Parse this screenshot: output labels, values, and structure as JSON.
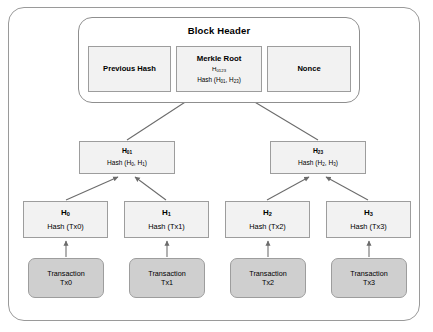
{
  "diagram": {
    "title": "Block Header",
    "header_fields": [
      {
        "name": "previous-hash",
        "label": "Previous Hash"
      },
      {
        "name": "merkle-root",
        "label": "Merkle Root",
        "hash_id": "H0123",
        "formula": "Hash (H01, H23)"
      },
      {
        "name": "nonce",
        "label": "Nonce"
      }
    ],
    "intermediate_nodes": [
      {
        "name": "h01",
        "hash_id": "H01",
        "formula": "Hash (H0, H1)"
      },
      {
        "name": "h23",
        "hash_id": "H23",
        "formula": "Hash (H2, H3)"
      }
    ],
    "leaf_nodes": [
      {
        "name": "h0",
        "hash_id": "H0",
        "formula": "Hash (Tx0)"
      },
      {
        "name": "h1",
        "hash_id": "H1",
        "formula": "Hash (Tx1)"
      },
      {
        "name": "h2",
        "hash_id": "H2",
        "formula": "Hash (Tx2)"
      },
      {
        "name": "h3",
        "hash_id": "H3",
        "formula": "Hash (Tx3)"
      }
    ],
    "transactions": [
      {
        "name": "tx0",
        "label": "Transaction",
        "id": "Tx0"
      },
      {
        "name": "tx1",
        "label": "Transaction",
        "id": "Tx1"
      },
      {
        "name": "tx2",
        "label": "Transaction",
        "id": "Tx2"
      },
      {
        "name": "tx3",
        "label": "Transaction",
        "id": "Tx3"
      }
    ],
    "colors": {
      "frame_border": "#9a9a9a",
      "node_fill": "#f2f2f2",
      "node_border": "#9d9d9d",
      "transaction_fill": "#cfcfcf",
      "arrow": "#6b6b6b",
      "text": "#000000",
      "background": "#ffffff"
    }
  }
}
